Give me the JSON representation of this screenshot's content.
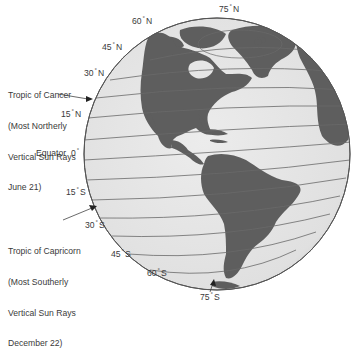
{
  "diagram": {
    "colors": {
      "background": "#ffffff",
      "ocean": "#e4e4e4",
      "land": "#5e5e5e",
      "gridline": "#6a6a6a",
      "outline": "#555555",
      "text": "#3a3a3a"
    },
    "latitude_labels": [
      {
        "id": "75n",
        "value": "75",
        "hemisphere": "N"
      },
      {
        "id": "60n",
        "value": "60",
        "hemisphere": "N"
      },
      {
        "id": "45n",
        "value": "45",
        "hemisphere": "N"
      },
      {
        "id": "30n",
        "value": "30",
        "hemisphere": "N"
      },
      {
        "id": "15n",
        "value": "15",
        "hemisphere": "N"
      },
      {
        "id": "eq",
        "name": "Equator",
        "value": "0"
      },
      {
        "id": "15s",
        "value": "15",
        "hemisphere": "S"
      },
      {
        "id": "30s",
        "value": "30",
        "hemisphere": "S"
      },
      {
        "id": "45s",
        "value": "45",
        "hemisphere": "S"
      },
      {
        "id": "60s",
        "value": "60",
        "hemisphere": "S"
      },
      {
        "id": "75s",
        "value": "75",
        "hemisphere": "S"
      }
    ],
    "annotations": {
      "cancer": {
        "line1": "Tropic of Cancer",
        "line2": "(Most Northerly",
        "line3": "Vertical Sun Rays",
        "line4": "June 21)"
      },
      "capricorn": {
        "line1": "Tropic of Capricorn",
        "line2": "(Most Southerly",
        "line3": "Vertical Sun Rays",
        "line4": "December 22)"
      }
    },
    "degree_symbol": "°"
  }
}
